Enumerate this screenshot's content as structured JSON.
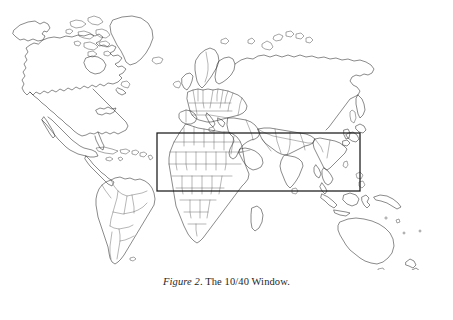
{
  "figure": {
    "caption_label": "Figure 2",
    "caption_separator": ".",
    "caption_text": " The 10/40 Window.",
    "caption_full": "Figure 2. The 10/40 Window."
  },
  "map": {
    "title": "world-map-outline",
    "projection": "equirectangular",
    "background_color": "#ffffff",
    "coastline_color": "#2b2b2b",
    "country_border_color": "#4a4a4a",
    "overlay_color": "#1a1a1a",
    "regions": [
      "North America",
      "South America",
      "Greenland",
      "Europe",
      "Africa",
      "Asia",
      "Australia",
      "New Zealand",
      "Japan",
      "Indonesia",
      "Madagascar",
      "Iceland",
      "British Isles"
    ]
  },
  "overlay": {
    "name": "10/40 Window",
    "latitude_north": "40",
    "latitude_south": "10",
    "rect": {
      "x": 157,
      "y": 133,
      "width": 203,
      "height": 58
    }
  },
  "chart_data": {
    "type": "map",
    "title": "The 10/40 Window",
    "overlay_band": {
      "lat_min": 10,
      "lat_max": 40,
      "lon_min": -20,
      "lon_max": 140
    },
    "grid": false,
    "legend": "none"
  }
}
